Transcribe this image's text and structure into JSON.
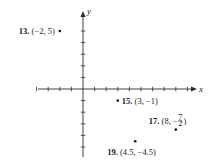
{
  "chart_data": {
    "type": "scatter",
    "title": "",
    "xlabel": "x",
    "ylabel": "y",
    "xlim": [
      -4,
      9
    ],
    "ylim": [
      -5,
      5
    ],
    "x_ticks": [
      -4,
      -3,
      -2,
      -1,
      1,
      2,
      3,
      4,
      5,
      6,
      7,
      8,
      9
    ],
    "y_ticks": [
      -5,
      -4,
      -3,
      -2,
      -1,
      1,
      2,
      3,
      4,
      5
    ],
    "grid": false,
    "tick_labels_shown": false,
    "points": [
      {
        "id": "13",
        "number": "13.",
        "coords_text": "(−2, 5)",
        "x": -2,
        "y": 5,
        "label_side": "left"
      },
      {
        "id": "15",
        "number": "15.",
        "coords_text": "(3, −1)",
        "x": 3,
        "y": -1,
        "label_side": "right"
      },
      {
        "id": "17",
        "number": "17.",
        "coords_text_prefix": "(8, −",
        "fraction": {
          "num": "7",
          "den": "2"
        },
        "coords_text_suffix": ")",
        "x": 8,
        "y": -3.5,
        "label_side": "above-left"
      },
      {
        "id": "19",
        "number": "19.",
        "coords_text": "(4.5, −4.5)",
        "x": 4.5,
        "y": -4.5,
        "label_side": "below"
      }
    ]
  }
}
